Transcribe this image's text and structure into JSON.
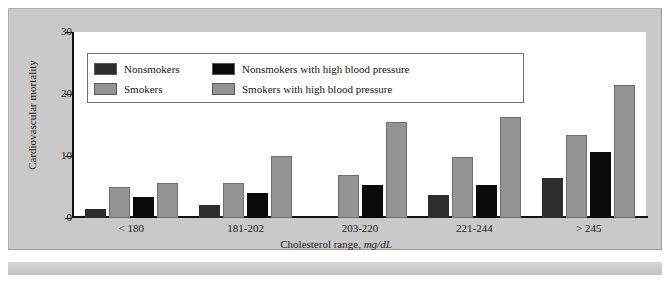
{
  "chart_data": {
    "type": "bar",
    "title": "",
    "xlabel": "Cholesterol range, mg/dL",
    "xlabel_main": "Cholesterol range,",
    "xlabel_units": "mg/dL",
    "ylabel": "Cardiovascular mortality",
    "ylim": [
      0,
      30
    ],
    "yticks": [
      0,
      10,
      20,
      30
    ],
    "ytick_labels": [
      "0",
      "10",
      "20",
      "30"
    ],
    "grid": false,
    "legend_position": "upper-left-inside",
    "categories": [
      "< 180",
      "181-202",
      "203-220",
      "221-244",
      "> 245"
    ],
    "series": [
      {
        "name": "Nonsmokers",
        "color": "#2d2d2d",
        "values": [
          1.5,
          2.1,
          0,
          3.7,
          6.4
        ]
      },
      {
        "name": "Smokers",
        "color": "#949494",
        "values": [
          5.0,
          5.7,
          7.0,
          9.8,
          13.4
        ]
      },
      {
        "name": "Nonsmokers with high blood pressure",
        "color": "#0a0a0a",
        "values": [
          3.4,
          4.1,
          5.4,
          5.3,
          10.7
        ]
      },
      {
        "name": "Smokers with high blood pressure",
        "color": "#949494",
        "values": [
          5.7,
          10.0,
          15.5,
          16.3,
          21.4
        ]
      }
    ]
  },
  "legend": {
    "entries": [
      {
        "label": "Nonsmokers",
        "color": "#2d2d2d"
      },
      {
        "label": "Nonsmokers with high blood pressure",
        "color": "#0a0a0a"
      },
      {
        "label": "Smokers",
        "color": "#949494"
      },
      {
        "label": "Smokers with high blood pressure",
        "color": "#949494"
      }
    ]
  },
  "colors": {
    "figure_background": "#c9c9c9",
    "plot_background": "#ffffff",
    "axis": "#111111",
    "text": "#1b1b1b"
  }
}
